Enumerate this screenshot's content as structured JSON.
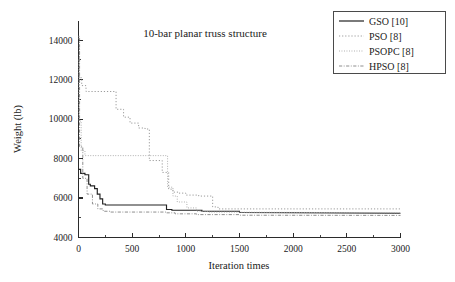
{
  "chart_data": {
    "type": "line",
    "title": "10-bar planar truss structure",
    "xlabel": "Iteration times",
    "ylabel": "Weight (lb)",
    "xlim": [
      0,
      3000
    ],
    "ylim": [
      4000,
      15000
    ],
    "xticks": [
      0,
      500,
      1000,
      1500,
      2000,
      2500,
      3000
    ],
    "xtick_labels": [
      "0",
      "500",
      "1000",
      "1500",
      "2000",
      "2500",
      "3000"
    ],
    "yticks": [
      4000,
      6000,
      8000,
      10000,
      12000,
      14000
    ],
    "ytick_labels": [
      "4000",
      "6000",
      "8000",
      "10000",
      "12000",
      "14000"
    ],
    "y_minor_ticks": [
      5000,
      7000,
      9000,
      11000,
      13000
    ],
    "grid": false,
    "legend_position": "top-right",
    "series": [
      {
        "name": "GSO [10]",
        "style": "solid",
        "color": "#222222",
        "x": [
          0,
          20,
          20,
          60,
          60,
          95,
          95,
          110,
          110,
          150,
          150,
          175,
          175,
          200,
          200,
          225,
          225,
          250,
          250,
          820,
          820,
          870,
          870,
          1150,
          1150,
          1500,
          1500,
          3000
        ],
        "y": [
          7450,
          7450,
          7250,
          7250,
          7180,
          7180,
          6700,
          6700,
          6620,
          6620,
          6480,
          6480,
          6200,
          6200,
          5960,
          5960,
          5700,
          5700,
          5650,
          5650,
          5420,
          5420,
          5380,
          5380,
          5330,
          5330,
          5270,
          5230
        ]
      },
      {
        "name": "PSO [8]",
        "style": "dotted",
        "color": "#9a9a9a",
        "x": [
          0,
          8,
          8,
          30,
          30,
          70,
          70,
          350,
          350,
          420,
          420,
          480,
          480,
          560,
          560,
          620,
          620,
          660,
          660,
          780,
          780,
          840,
          840,
          880,
          880,
          930,
          930,
          1000,
          1000,
          1120,
          1120,
          1250,
          1250,
          1300,
          1300,
          3000
        ],
        "y": [
          14200,
          14200,
          12100,
          12100,
          11700,
          11700,
          11400,
          11400,
          10500,
          10500,
          10100,
          10100,
          9800,
          9800,
          9550,
          9550,
          9500,
          9500,
          7900,
          7900,
          7300,
          7300,
          6450,
          6450,
          6300,
          6300,
          6250,
          6250,
          6150,
          6150,
          6100,
          6100,
          5550,
          5550,
          5450,
          5450
        ]
      },
      {
        "name": "PSOPC [8]",
        "style": "dotted",
        "color": "#a8a8a8",
        "x": [
          0,
          5,
          5,
          25,
          25,
          60,
          60,
          830,
          830,
          880,
          880,
          920,
          920,
          1010,
          1010,
          1100,
          1100,
          1200,
          1200,
          3000
        ],
        "y": [
          13000,
          13000,
          9900,
          9900,
          8400,
          8400,
          8150,
          8150,
          6550,
          6550,
          6100,
          6100,
          5800,
          5800,
          5500,
          5500,
          5330,
          5330,
          5290,
          5250
        ]
      },
      {
        "name": "HPSO [8]",
        "style": "dash-dot",
        "color": "#8e8e8e",
        "x": [
          0,
          10,
          10,
          40,
          40,
          80,
          80,
          130,
          130,
          180,
          180,
          230,
          230,
          300,
          300,
          820,
          820,
          900,
          900,
          1100,
          1100,
          1500,
          1500,
          3000
        ],
        "y": [
          14100,
          14100,
          8600,
          8600,
          7000,
          7000,
          6200,
          6200,
          5700,
          5700,
          5450,
          5450,
          5330,
          5330,
          5290,
          5290,
          5250,
          5250,
          5200,
          5200,
          5160,
          5160,
          5130,
          5120
        ]
      }
    ]
  },
  "legend": {
    "entries": [
      {
        "label": "GSO [10]"
      },
      {
        "label": "PSO [8]"
      },
      {
        "label": "PSOPC [8]"
      },
      {
        "label": "HPSO [8]"
      }
    ]
  }
}
